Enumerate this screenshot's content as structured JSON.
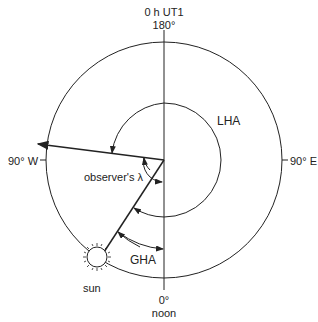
{
  "labels": {
    "top_time": "0 h UT1",
    "top_angle": "180°",
    "west": "90° W",
    "east": "90° E",
    "bottom_angle": "0°",
    "bottom_time": "noon",
    "lha": "LHA",
    "observer_lambda": "observer's λ",
    "gha": "GHA",
    "sun": "sun"
  },
  "colors": {
    "line": "#222222",
    "background": "#ffffff"
  }
}
